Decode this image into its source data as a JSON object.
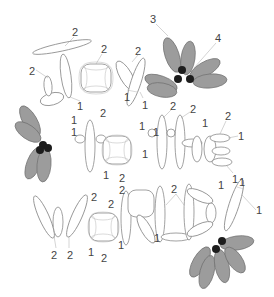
{
  "diagram": {
    "title": "",
    "words": [
      "JOY",
      "TO",
      "THE",
      "WORLD!"
    ],
    "colors": {
      "background": "#ffffff",
      "balloon_outline": "#8a8a8a",
      "flower_petal": "#9c9c9c",
      "flower_knot": "#1d1d1d",
      "label_text": "#444444"
    },
    "flowers": [
      {
        "name": "flower-top-right",
        "petals": 6
      },
      {
        "name": "flower-left",
        "petals": 4
      },
      {
        "name": "flower-bottom-right",
        "petals": 5
      }
    ],
    "labels": [
      {
        "id": "j-top",
        "text": "2",
        "x": 72,
        "y": 27
      },
      {
        "id": "o1-top",
        "text": "2",
        "x": 101,
        "y": 44
      },
      {
        "id": "j-left",
        "text": "2",
        "x": 29,
        "y": 66
      },
      {
        "id": "y-top",
        "text": "2",
        "x": 135,
        "y": 46
      },
      {
        "id": "y-mid",
        "text": "1",
        "x": 124,
        "y": 92
      },
      {
        "id": "y-bot",
        "text": "1",
        "x": 142,
        "y": 100
      },
      {
        "id": "flower-3",
        "text": "3",
        "x": 150,
        "y": 14
      },
      {
        "id": "flower-4",
        "text": "4",
        "x": 215,
        "y": 33
      },
      {
        "id": "o1-bot-1",
        "text": "1",
        "x": 77,
        "y": 101
      },
      {
        "id": "o1-bot-2",
        "text": "2",
        "x": 100,
        "y": 108
      },
      {
        "id": "t1-a",
        "text": "1",
        "x": 71,
        "y": 115
      },
      {
        "id": "t1-b",
        "text": "1",
        "x": 71,
        "y": 127
      },
      {
        "id": "t2-top",
        "text": "2",
        "x": 170,
        "y": 101
      },
      {
        "id": "t2-cross",
        "text": "2",
        "x": 190,
        "y": 104
      },
      {
        "id": "t2-side",
        "text": "1",
        "x": 139,
        "y": 121
      },
      {
        "id": "h-top",
        "text": "1",
        "x": 202,
        "y": 118
      },
      {
        "id": "e-top",
        "text": "2",
        "x": 225,
        "y": 111
      },
      {
        "id": "e-right",
        "text": "1",
        "x": 238,
        "y": 131
      },
      {
        "id": "o2-bot-1",
        "text": "1",
        "x": 103,
        "y": 170
      },
      {
        "id": "o2-bot-2",
        "text": "2",
        "x": 119,
        "y": 173
      },
      {
        "id": "t2-lower",
        "text": "1",
        "x": 142,
        "y": 149
      },
      {
        "id": "o2-side",
        "text": "1",
        "x": 153,
        "y": 127
      },
      {
        "id": "e-bot",
        "text": "1",
        "x": 232,
        "y": 174
      },
      {
        "id": "w-o-top",
        "text": "2",
        "x": 91,
        "y": 192
      },
      {
        "id": "w-o-left",
        "text": "2",
        "x": 108,
        "y": 199
      },
      {
        "id": "r-top",
        "text": "2",
        "x": 119,
        "y": 185
      },
      {
        "id": "d-top",
        "text": "2",
        "x": 171,
        "y": 184
      },
      {
        "id": "l-top",
        "text": "1",
        "x": 218,
        "y": 180
      },
      {
        "id": "excl-top",
        "text": "1",
        "x": 239,
        "y": 177
      },
      {
        "id": "excl-right",
        "text": "1",
        "x": 256,
        "y": 205
      },
      {
        "id": "w-bot-1",
        "text": "2",
        "x": 51,
        "y": 250
      },
      {
        "id": "w-bot-2",
        "text": "2",
        "x": 67,
        "y": 250
      },
      {
        "id": "o3-bot-1",
        "text": "1",
        "x": 88,
        "y": 247
      },
      {
        "id": "o3-bot-2",
        "text": "2",
        "x": 101,
        "y": 253
      },
      {
        "id": "r-bot",
        "text": "1",
        "x": 118,
        "y": 240
      },
      {
        "id": "l-bot",
        "text": "1",
        "x": 154,
        "y": 233
      }
    ]
  }
}
